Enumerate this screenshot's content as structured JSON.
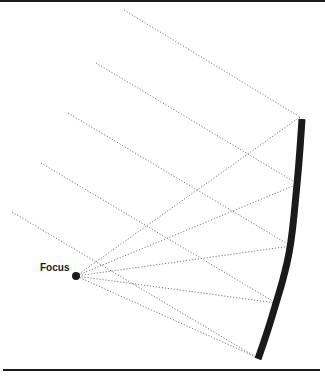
{
  "diagram": {
    "title": "",
    "focus": {
      "label": "Focus",
      "point": [
        76,
        276
      ]
    },
    "mirror": {
      "type": "concave",
      "points": [
        [
          302,
          119
        ],
        [
          300,
          150
        ],
        [
          297,
          185
        ],
        [
          291,
          246
        ],
        [
          283,
          280
        ],
        [
          276,
          303
        ],
        [
          268,
          330
        ],
        [
          258,
          359
        ]
      ]
    },
    "incident_rays": [
      {
        "from": [
          124,
          10
        ],
        "to": [
          300,
          117
        ]
      },
      {
        "from": [
          96,
          63
        ],
        "to": [
          298,
          184
        ]
      },
      {
        "from": [
          68,
          113
        ],
        "to": [
          291,
          246
        ]
      },
      {
        "from": [
          41,
          163
        ],
        "to": [
          276,
          303
        ]
      },
      {
        "from": [
          12,
          212
        ],
        "to": [
          256,
          357
        ]
      }
    ],
    "reflected_rays": [
      {
        "from": [
          300,
          117
        ],
        "to": [
          76,
          276
        ]
      },
      {
        "from": [
          298,
          184
        ],
        "to": [
          76,
          276
        ]
      },
      {
        "from": [
          291,
          246
        ],
        "to": [
          76,
          276
        ]
      },
      {
        "from": [
          276,
          303
        ],
        "to": [
          76,
          276
        ]
      },
      {
        "from": [
          256,
          357
        ],
        "to": [
          76,
          276
        ]
      }
    ],
    "colors": {
      "mirror": "#1a1a1a",
      "ray": "#7a7a7a",
      "focus": "#1a1a1a"
    }
  }
}
